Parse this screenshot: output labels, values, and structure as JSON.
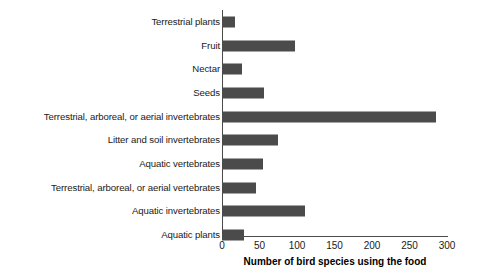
{
  "chart_data": {
    "type": "bar",
    "orientation": "horizontal",
    "title": "",
    "xlabel": "Number of bird species using the food",
    "ylabel": "",
    "xlim": [
      0,
      300
    ],
    "xticks": [
      0,
      50,
      100,
      150,
      200,
      250,
      300
    ],
    "xtick_labels": [
      "0",
      "50",
      "100",
      "150",
      "200",
      "250",
      "300"
    ],
    "grid": false,
    "legend": "none",
    "bar_color": "#4b4b4b",
    "categories": [
      "Terrestrial plants",
      "Fruit",
      "Nectar",
      "Seeds",
      "Terrestrial, arboreal, or aerial invertebrates",
      "Litter and soil invertebrates",
      "Aquatic vertebrates",
      "Terrestrial, arboreal, or aerial vertebrates",
      "Aquatic invertebrates",
      "Aquatic plants"
    ],
    "values": [
      17,
      97,
      27,
      56,
      285,
      75,
      55,
      45,
      111,
      29
    ],
    "bars": [
      {
        "label": "Terrestrial plants",
        "value": 17
      },
      {
        "label": "Fruit",
        "value": 97
      },
      {
        "label": "Nectar",
        "value": 27
      },
      {
        "label": "Seeds",
        "value": 56
      },
      {
        "label": "Terrestrial, arboreal, or aerial invertebrates",
        "value": 285
      },
      {
        "label": "Litter and soil invertebrates",
        "value": 75
      },
      {
        "label": "Aquatic vertebrates",
        "value": 55
      },
      {
        "label": "Terrestrial, arboreal, or aerial vertebrates",
        "value": 45
      },
      {
        "label": "Aquatic invertebrates",
        "value": 111
      },
      {
        "label": "Aquatic plants",
        "value": 29
      }
    ]
  }
}
